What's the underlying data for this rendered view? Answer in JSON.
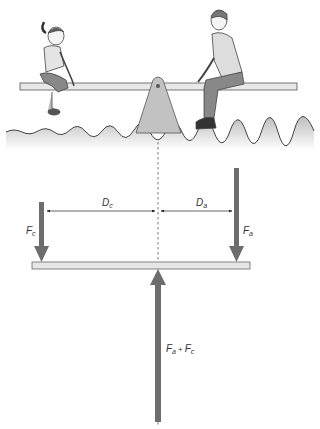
{
  "diagram": {
    "labels": {
      "d_child": "D",
      "d_child_sub": "c",
      "d_adult": "D",
      "d_adult_sub": "a",
      "f_child": "F",
      "f_child_sub": "c",
      "f_adult": "F",
      "f_adult_sub": "a",
      "f_sum_a": "F",
      "f_sum_a_sub": "a",
      "f_sum_plus": "+",
      "f_sum_c": "F",
      "f_sum_c_sub": "c"
    },
    "colors": {
      "arrow": "#6d6d6d",
      "plank": "#e6e6e6",
      "fulcrum": "#bdbdbd",
      "ground": "#d9d9d9",
      "line": "#333333"
    }
  }
}
